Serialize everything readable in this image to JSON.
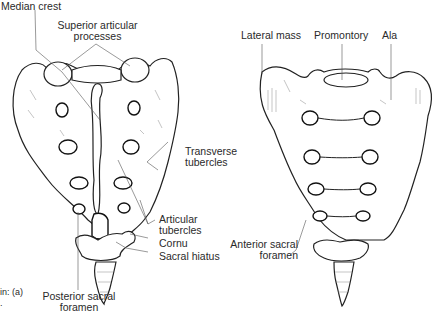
{
  "figure": {
    "left_view": {
      "name": "Posterior view of sacrum",
      "labels": {
        "median_crest": "Median crest",
        "superior_articular_1": "Superior articular",
        "superior_articular_2": "processes",
        "transverse_1": "Transverse",
        "transverse_2": "tubercles",
        "articular_1": "Articular",
        "articular_2": "tubercles",
        "cornu": "Cornu",
        "sacral_hiatus": "Sacral hiatus",
        "posterior_foramen_1": "Posterior sacral",
        "posterior_foramen_2": "foramen"
      }
    },
    "right_view": {
      "name": "Anterior view of sacrum",
      "labels": {
        "lateral_mass": "Lateral mass",
        "promontory": "Promontory",
        "ala": "Ala",
        "anterior_foramen_1": "Anterior sacral",
        "anterior_foramen_2": "foramen"
      }
    },
    "caption_fragment": {
      "line1": "in: (a)",
      "line2": "."
    },
    "colors": {
      "line": "#222222",
      "label": "#2a2a2a",
      "background": "#ffffff"
    }
  }
}
